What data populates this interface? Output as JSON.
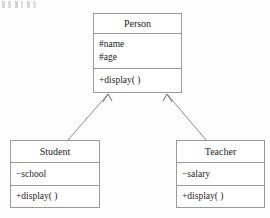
{
  "diagram": {
    "type": "uml-class-diagram",
    "line_color": "#8e8e8e",
    "border_color": "#9a9a9a",
    "text_color": "#1c1c1c",
    "background": "#fefefe"
  },
  "classes": {
    "person": {
      "name": "Person",
      "attributes": [
        "#name",
        "#age"
      ],
      "methods": [
        "+display( )"
      ]
    },
    "student": {
      "name": "Student",
      "attributes": [
        "−school"
      ],
      "methods": [
        "+display( )"
      ]
    },
    "teacher": {
      "name": "Teacher",
      "attributes": [
        "−salary"
      ],
      "methods": [
        "+display( )"
      ]
    }
  },
  "relationships": [
    {
      "kind": "generalization",
      "from": "Student",
      "to": "Person",
      "arrow": "open-arrowhead"
    },
    {
      "kind": "generalization",
      "from": "Teacher",
      "to": "Person",
      "arrow": "open-arrowhead"
    }
  ]
}
